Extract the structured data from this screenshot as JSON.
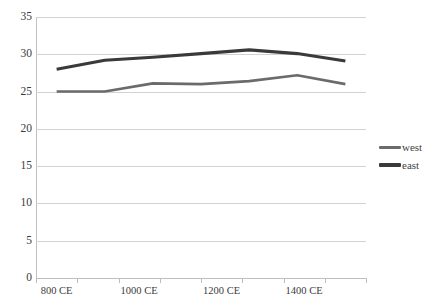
{
  "chart_data": {
    "type": "line",
    "title": "",
    "subtitle": "",
    "xlabel": "",
    "ylabel": "",
    "grid": true,
    "legend_position": "right",
    "ylim": [
      0,
      35
    ],
    "ytick_step": 5,
    "yticks": [
      "0",
      "5",
      "10",
      "15",
      "20",
      "25",
      "30",
      "35"
    ],
    "categories": [
      "800 CE",
      "900 CE",
      "1000 CE",
      "1100 CE",
      "1200 CE",
      "1300 CE",
      "1400 CE"
    ],
    "xtick_labels": [
      "800 CE",
      "1000 CE",
      "1200 CE",
      "1400 CE"
    ],
    "series": [
      {
        "name": "west",
        "color": "#6b6b6b",
        "width": 2.6,
        "values": [
          25,
          25,
          26.1,
          26,
          26.4,
          27.2,
          26
        ]
      },
      {
        "name": "east",
        "color": "#3a3a3a",
        "width": 3.2,
        "values": [
          28,
          29.2,
          29.6,
          30.1,
          30.6,
          30.1,
          29.1
        ]
      }
    ]
  },
  "legend": {
    "entries": [
      {
        "label": "west"
      },
      {
        "label": "east"
      }
    ]
  },
  "colors": {
    "west": "#6b6b6b",
    "east": "#3a3a3a",
    "grid": "#d2d2d2",
    "axis": "#bfbfbf",
    "text": "#3b3b3b",
    "background": "#ffffff"
  }
}
